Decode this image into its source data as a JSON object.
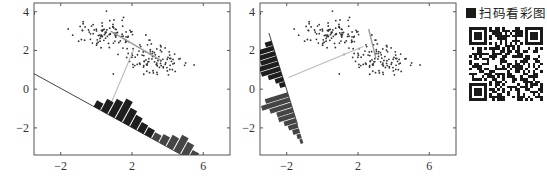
{
  "chart_data": [
    {
      "type": "scatter",
      "title": "",
      "description": "Two Gaussian clusters projected onto a line (poor projection direction); histogram of projected values drawn along the projection line",
      "xlabel": "",
      "ylabel": "",
      "xlim": [
        -3.5,
        7.5
      ],
      "ylim": [
        -3.4,
        4.45
      ],
      "xticks": [
        -2,
        2,
        6
      ],
      "yticks": [
        -2,
        0,
        2,
        4
      ],
      "grid": false,
      "legend": null,
      "series": [
        {
          "name": "class-1",
          "center": [
            0.5,
            2.9
          ],
          "spread": [
            1.3,
            0.45
          ],
          "n": 100
        },
        {
          "name": "class-2",
          "center": [
            3.4,
            1.5
          ],
          "spread": [
            1.3,
            0.55
          ],
          "n": 100
        }
      ],
      "mean_connector": {
        "from": [
          0.8,
          3.0
        ],
        "to": [
          3.6,
          1.5
        ]
      },
      "projection_line": {
        "from": [
          -3.5,
          0.8
        ],
        "to": [
          4.8,
          -3.4
        ]
      },
      "projection_connector": {
        "from": [
          2.1,
          2.05
        ],
        "to": [
          0.7,
          -1.0
        ]
      },
      "histogram": {
        "orientation": "along projection line",
        "bin_heights": [
          0.3,
          0.55,
          0.75,
          0.95,
          0.7,
          0.55,
          0.4,
          0.35,
          0.3,
          0.4,
          0.55,
          0.75,
          0.6,
          0.4,
          0.3,
          0.25,
          0.2
        ],
        "colors": [
          "#1e1e1e",
          "#454545"
        ]
      }
    },
    {
      "type": "scatter",
      "title": "",
      "description": "Same two clusters projected onto Fisher's discriminant direction; histogram of projected values shows two well-separated groups",
      "xlabel": "",
      "ylabel": "",
      "xlim": [
        -3.5,
        7.5
      ],
      "ylim": [
        -3.4,
        4.45
      ],
      "xticks": [
        -2,
        2,
        6
      ],
      "yticks": [
        -2,
        0,
        2,
        4
      ],
      "grid": false,
      "legend": null,
      "series": [
        {
          "name": "class-1",
          "center": [
            0.5,
            2.9
          ],
          "spread": [
            1.3,
            0.45
          ],
          "n": 100
        },
        {
          "name": "class-2",
          "center": [
            3.4,
            1.5
          ],
          "spread": [
            1.3,
            0.55
          ],
          "n": 100
        }
      ],
      "mean_connector": {
        "from": [
          2.6,
          3.1
        ],
        "to": [
          3.0,
          1.6
        ]
      },
      "projection_line": {
        "from": [
          -3.0,
          2.9
        ],
        "to": [
          -1.4,
          -1.8
        ]
      },
      "projection_connector": {
        "from": [
          2.3,
          2.2
        ],
        "to": [
          -1.9,
          0.6
        ]
      },
      "histogram": {
        "orientation": "along projection line",
        "bin_heights_upper": [
          0.25,
          0.55,
          0.75,
          0.6,
          0.9,
          0.7,
          0.5,
          0.3,
          0.2
        ],
        "bin_heights_lower": [
          0.85,
          1.05,
          0.8,
          0.6,
          0.6,
          0.45,
          0.35,
          0.25,
          0.15,
          0.1
        ],
        "colors": [
          "#1e1e1e",
          "#454545"
        ]
      }
    }
  ],
  "plots": {
    "left": {
      "xtick_labels": [
        "−2",
        "2",
        "6"
      ],
      "ytick_labels": [
        "4",
        "2",
        "0",
        "−2"
      ]
    },
    "right": {
      "xtick_labels": [
        "−2",
        "2",
        "6"
      ],
      "ytick_labels": [
        "4",
        "2",
        "0",
        "−2"
      ]
    }
  },
  "qr": {
    "label": "扫码看彩图",
    "icon": "qr-code-icon"
  }
}
